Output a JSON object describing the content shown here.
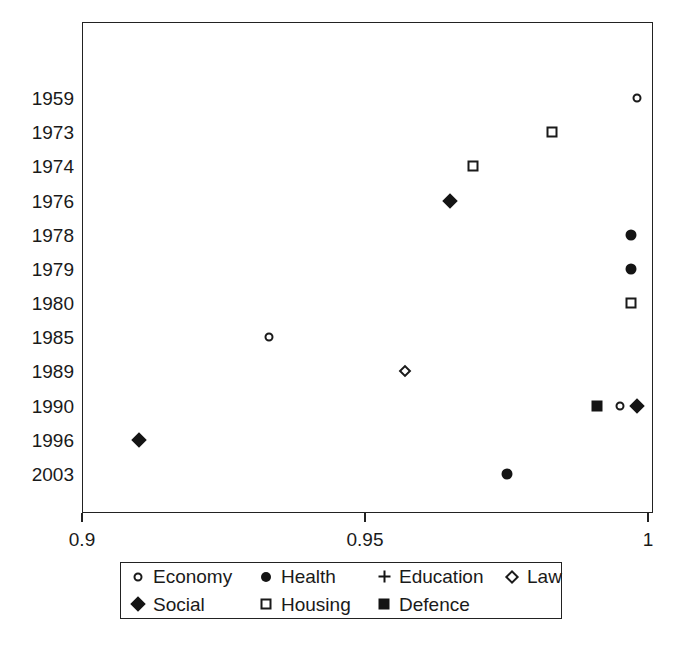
{
  "chart_data": {
    "type": "scatter",
    "title": "",
    "subtitle": "",
    "xlabel": "",
    "ylabel": "",
    "xlim": [
      0.9,
      1.0
    ],
    "xticks": [
      0.9,
      0.95,
      1.0
    ],
    "xticklabels": [
      "0.9",
      "0.95",
      "1"
    ],
    "categories": [
      "1959",
      "1973",
      "1974",
      "1976",
      "1978",
      "1979",
      "1980",
      "1985",
      "1989",
      "1990",
      "1996",
      "2003"
    ],
    "grid": false,
    "frame": true,
    "legend_position": "below-plot",
    "marker_color": "#141414",
    "series": [
      {
        "name": "Economy",
        "marker": "open-circle",
        "points": [
          {
            "category": "1959",
            "x": 0.998
          },
          {
            "category": "1985",
            "x": 0.933
          },
          {
            "category": "1990",
            "x": 0.995
          }
        ]
      },
      {
        "name": "Health",
        "marker": "filled-circle",
        "points": [
          {
            "category": "1978",
            "x": 0.997
          },
          {
            "category": "1979",
            "x": 0.997
          },
          {
            "category": "2003",
            "x": 0.975
          }
        ]
      },
      {
        "name": "Education",
        "marker": "plus",
        "points": []
      },
      {
        "name": "Law",
        "marker": "open-diamond",
        "points": [
          {
            "category": "1989",
            "x": 0.957
          }
        ]
      },
      {
        "name": "Social",
        "marker": "filled-diamond",
        "points": [
          {
            "category": "1976",
            "x": 0.965
          },
          {
            "category": "1990",
            "x": 0.998
          },
          {
            "category": "1996",
            "x": 0.91
          }
        ]
      },
      {
        "name": "Housing",
        "marker": "open-square",
        "points": [
          {
            "category": "1973",
            "x": 0.983
          },
          {
            "category": "1974",
            "x": 0.969
          },
          {
            "category": "1980",
            "x": 0.997
          }
        ]
      },
      {
        "name": "Defence",
        "marker": "filled-square",
        "points": [
          {
            "category": "1990",
            "x": 0.991
          }
        ]
      }
    ]
  },
  "legend": {
    "entries": [
      {
        "label": "Economy",
        "marker": "open-circle"
      },
      {
        "label": "Health",
        "marker": "filled-circle"
      },
      {
        "label": "Education",
        "marker": "plus"
      },
      {
        "label": "Law",
        "marker": "open-diamond"
      },
      {
        "label": "Social",
        "marker": "filled-diamond"
      },
      {
        "label": "Housing",
        "marker": "open-square"
      },
      {
        "label": "Defence",
        "marker": "filled-square"
      }
    ]
  }
}
